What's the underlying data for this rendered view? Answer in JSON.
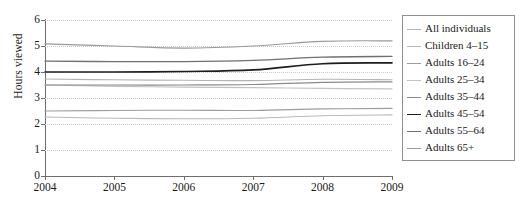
{
  "chart_data": {
    "type": "line",
    "title": "",
    "xlabel": "",
    "ylabel": "Hours viewed",
    "x": [
      2004,
      2005,
      2006,
      2007,
      2008,
      2009
    ],
    "xtick_labels": [
      "2004",
      "2005",
      "2006",
      "2007",
      "2008",
      "2009"
    ],
    "ytick_labels": [
      "0",
      "1",
      "2",
      "3",
      "4",
      "5",
      "6"
    ],
    "yticks": [
      0,
      1,
      2,
      3,
      4,
      5,
      6
    ],
    "xlim": [
      2004,
      2009
    ],
    "ylim": [
      0,
      6
    ],
    "grid": "horizontal-dotted",
    "legend_position": "right",
    "series": [
      {
        "name": "All individuals",
        "color": "#b4b4b4",
        "width": 1.1,
        "values": [
          3.73,
          3.7,
          3.68,
          3.67,
          3.72,
          3.7
        ]
      },
      {
        "name": "Children 4–15",
        "color": "#b9b9b9",
        "width": 1.1,
        "values": [
          2.27,
          2.22,
          2.2,
          2.22,
          2.32,
          2.35
        ]
      },
      {
        "name": "Adults 16–24",
        "color": "#9d9d9d",
        "width": 1.1,
        "values": [
          2.5,
          2.52,
          2.53,
          2.52,
          2.58,
          2.6
        ]
      },
      {
        "name": "Adults 25–34",
        "color": "#c2c2c2",
        "width": 1.2,
        "values": [
          3.5,
          3.45,
          3.42,
          3.4,
          3.37,
          3.35
        ]
      },
      {
        "name": "Adults 35–44",
        "color": "#8a8a8a",
        "width": 1.2,
        "values": [
          3.5,
          3.5,
          3.5,
          3.52,
          3.6,
          3.62
        ]
      },
      {
        "name": "Adults 45–54",
        "color": "#1c1c1c",
        "width": 1.6,
        "values": [
          4.0,
          4.0,
          4.02,
          4.08,
          4.32,
          4.35
        ]
      },
      {
        "name": "Adults 55–64",
        "color": "#707070",
        "width": 1.3,
        "values": [
          4.42,
          4.4,
          4.4,
          4.45,
          4.57,
          4.6
        ]
      },
      {
        "name": "Adults 65+",
        "color": "#9a9a9a",
        "width": 1.2,
        "values": [
          5.08,
          5.0,
          4.92,
          5.0,
          5.18,
          5.2
        ]
      }
    ]
  },
  "axes": {
    "y_title": "Hours viewed"
  },
  "legend": {
    "items": [
      {
        "label": "All individuals"
      },
      {
        "label": "Children 4–15"
      },
      {
        "label": "Adults 16–24"
      },
      {
        "label": "Adults 25–34"
      },
      {
        "label": "Adults 35–44"
      },
      {
        "label": "Adults 45–54"
      },
      {
        "label": "Adults 55–64"
      },
      {
        "label": "Adults 65+"
      }
    ]
  }
}
